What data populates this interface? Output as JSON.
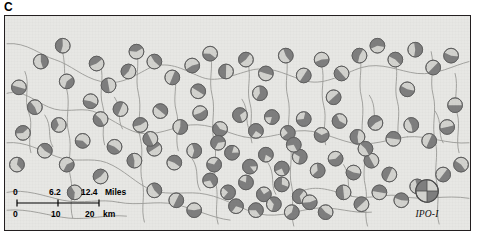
{
  "panel": {
    "label": "C"
  },
  "colors": {
    "map_background": "#e7e7e4",
    "frame": "#231f20",
    "stream": "#9a9a96",
    "pie_dark": "#7e7e7e",
    "pie_light": "#d2d2ce",
    "pie_stroke": "#5b5b5b",
    "text": "#000000"
  },
  "scalebar": {
    "miles": {
      "ticks": [
        "0",
        "6.2",
        "12.4"
      ],
      "unit": "Miles"
    },
    "km": {
      "ticks": [
        "0",
        "10",
        "20"
      ],
      "unit": "km"
    }
  },
  "legend": {
    "label": "IPO-I",
    "symbol": "pie-quadrant-icon",
    "quadrants": [
      "dark",
      "light",
      "light",
      "dark"
    ]
  },
  "chart_data": {
    "type": "pie",
    "subtitle": "Panel C",
    "xlabel": "",
    "ylabel": "",
    "legend_position": "bottom-right",
    "grid": false,
    "series": [
      {
        "name": "IPO-I allele (dark sector)",
        "color": "#7e7e7e"
      },
      {
        "name": "alternate allele (light sector)",
        "color": "#d2d2ce"
      }
    ],
    "units": {
      "distance_primary": "Miles",
      "distance_secondary": "km"
    },
    "scale_miles": [
      0,
      6.2,
      12.4
    ],
    "scale_km": [
      0,
      10,
      20
    ],
    "note": "Each marker is a two-sector pie whose dark fraction encodes the IPO-I allele frequency at that site; markers are positioned along a dendritic stream network.",
    "points": [
      {
        "x": 36,
        "y": 46,
        "f": 0.45
      },
      {
        "x": 62,
        "y": 66,
        "f": 0.4
      },
      {
        "x": 14,
        "y": 72,
        "f": 0.5
      },
      {
        "x": 30,
        "y": 92,
        "f": 0.45
      },
      {
        "x": 54,
        "y": 110,
        "f": 0.35
      },
      {
        "x": 18,
        "y": 118,
        "f": 0.4
      },
      {
        "x": 40,
        "y": 136,
        "f": 0.45
      },
      {
        "x": 12,
        "y": 150,
        "f": 0.35
      },
      {
        "x": 62,
        "y": 150,
        "f": 0.4
      },
      {
        "x": 86,
        "y": 86,
        "f": 0.45
      },
      {
        "x": 104,
        "y": 70,
        "f": 0.5
      },
      {
        "x": 124,
        "y": 56,
        "f": 0.45
      },
      {
        "x": 132,
        "y": 36,
        "f": 0.4
      },
      {
        "x": 150,
        "y": 46,
        "f": 0.45
      },
      {
        "x": 168,
        "y": 62,
        "f": 0.5
      },
      {
        "x": 188,
        "y": 50,
        "f": 0.45
      },
      {
        "x": 206,
        "y": 38,
        "f": 0.4
      },
      {
        "x": 222,
        "y": 56,
        "f": 0.5
      },
      {
        "x": 242,
        "y": 44,
        "f": 0.45
      },
      {
        "x": 262,
        "y": 58,
        "f": 0.5
      },
      {
        "x": 282,
        "y": 40,
        "f": 0.45
      },
      {
        "x": 300,
        "y": 60,
        "f": 0.5
      },
      {
        "x": 318,
        "y": 44,
        "f": 0.45
      },
      {
        "x": 338,
        "y": 58,
        "f": 0.5
      },
      {
        "x": 356,
        "y": 40,
        "f": 0.55
      },
      {
        "x": 374,
        "y": 30,
        "f": 0.6
      },
      {
        "x": 392,
        "y": 44,
        "f": 0.55
      },
      {
        "x": 412,
        "y": 34,
        "f": 0.55
      },
      {
        "x": 430,
        "y": 52,
        "f": 0.5
      },
      {
        "x": 448,
        "y": 40,
        "f": 0.55
      },
      {
        "x": 96,
        "y": 104,
        "f": 0.45
      },
      {
        "x": 116,
        "y": 94,
        "f": 0.5
      },
      {
        "x": 136,
        "y": 110,
        "f": 0.45
      },
      {
        "x": 156,
        "y": 96,
        "f": 0.5
      },
      {
        "x": 176,
        "y": 112,
        "f": 0.55
      },
      {
        "x": 196,
        "y": 98,
        "f": 0.55
      },
      {
        "x": 216,
        "y": 114,
        "f": 0.6
      },
      {
        "x": 236,
        "y": 100,
        "f": 0.7
      },
      {
        "x": 252,
        "y": 116,
        "f": 0.75
      },
      {
        "x": 268,
        "y": 102,
        "f": 0.8
      },
      {
        "x": 284,
        "y": 118,
        "f": 0.75
      },
      {
        "x": 300,
        "y": 104,
        "f": 0.7
      },
      {
        "x": 318,
        "y": 120,
        "f": 0.65
      },
      {
        "x": 336,
        "y": 106,
        "f": 0.6
      },
      {
        "x": 354,
        "y": 122,
        "f": 0.55
      },
      {
        "x": 372,
        "y": 108,
        "f": 0.55
      },
      {
        "x": 390,
        "y": 124,
        "f": 0.5
      },
      {
        "x": 408,
        "y": 110,
        "f": 0.55
      },
      {
        "x": 426,
        "y": 126,
        "f": 0.5
      },
      {
        "x": 444,
        "y": 112,
        "f": 0.5
      },
      {
        "x": 110,
        "y": 132,
        "f": 0.45
      },
      {
        "x": 130,
        "y": 146,
        "f": 0.45
      },
      {
        "x": 150,
        "y": 134,
        "f": 0.5
      },
      {
        "x": 170,
        "y": 148,
        "f": 0.55
      },
      {
        "x": 190,
        "y": 136,
        "f": 0.6
      },
      {
        "x": 210,
        "y": 150,
        "f": 0.7
      },
      {
        "x": 228,
        "y": 138,
        "f": 0.8
      },
      {
        "x": 246,
        "y": 152,
        "f": 0.85
      },
      {
        "x": 262,
        "y": 140,
        "f": 0.8
      },
      {
        "x": 278,
        "y": 154,
        "f": 0.75
      },
      {
        "x": 296,
        "y": 142,
        "f": 0.7
      },
      {
        "x": 314,
        "y": 156,
        "f": 0.65
      },
      {
        "x": 332,
        "y": 144,
        "f": 0.6
      },
      {
        "x": 350,
        "y": 158,
        "f": 0.55
      },
      {
        "x": 368,
        "y": 146,
        "f": 0.5
      },
      {
        "x": 386,
        "y": 160,
        "f": 0.5
      },
      {
        "x": 206,
        "y": 166,
        "f": 0.7
      },
      {
        "x": 224,
        "y": 178,
        "f": 0.75
      },
      {
        "x": 242,
        "y": 168,
        "f": 0.8
      },
      {
        "x": 260,
        "y": 180,
        "f": 0.75
      },
      {
        "x": 278,
        "y": 170,
        "f": 0.7
      },
      {
        "x": 296,
        "y": 182,
        "f": 0.65
      },
      {
        "x": 232,
        "y": 192,
        "f": 0.7
      },
      {
        "x": 252,
        "y": 196,
        "f": 0.65
      },
      {
        "x": 270,
        "y": 190,
        "f": 0.65
      },
      {
        "x": 288,
        "y": 198,
        "f": 0.6
      },
      {
        "x": 306,
        "y": 188,
        "f": 0.55
      },
      {
        "x": 322,
        "y": 198,
        "f": 0.55
      },
      {
        "x": 340,
        "y": 178,
        "f": 0.5
      },
      {
        "x": 358,
        "y": 190,
        "f": 0.5
      },
      {
        "x": 376,
        "y": 178,
        "f": 0.5
      },
      {
        "x": 150,
        "y": 176,
        "f": 0.45
      },
      {
        "x": 172,
        "y": 186,
        "f": 0.5
      },
      {
        "x": 190,
        "y": 196,
        "f": 0.55
      },
      {
        "x": 78,
        "y": 126,
        "f": 0.4
      },
      {
        "x": 70,
        "y": 178,
        "f": 0.4
      },
      {
        "x": 96,
        "y": 162,
        "f": 0.45
      },
      {
        "x": 398,
        "y": 186,
        "f": 0.45
      },
      {
        "x": 414,
        "y": 172,
        "f": 0.45
      },
      {
        "x": 440,
        "y": 160,
        "f": 0.5
      },
      {
        "x": 452,
        "y": 90,
        "f": 0.5
      },
      {
        "x": 458,
        "y": 150,
        "f": 0.45
      },
      {
        "x": 58,
        "y": 30,
        "f": 0.45
      },
      {
        "x": 92,
        "y": 48,
        "f": 0.45
      },
      {
        "x": 194,
        "y": 76,
        "f": 0.5
      },
      {
        "x": 256,
        "y": 78,
        "f": 0.6
      },
      {
        "x": 330,
        "y": 82,
        "f": 0.5
      },
      {
        "x": 404,
        "y": 74,
        "f": 0.55
      },
      {
        "x": 146,
        "y": 124,
        "f": 0.5
      },
      {
        "x": 214,
        "y": 128,
        "f": 0.65
      },
      {
        "x": 290,
        "y": 130,
        "f": 0.7
      },
      {
        "x": 362,
        "y": 134,
        "f": 0.55
      }
    ]
  }
}
